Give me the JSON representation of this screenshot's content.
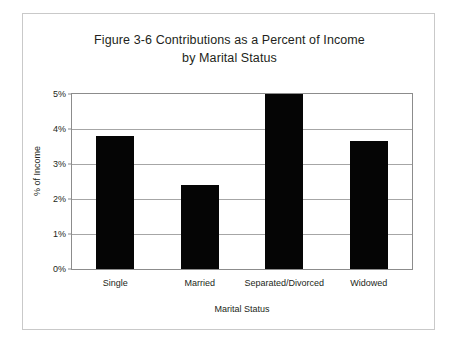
{
  "figure": {
    "border_color": "#c9c9c9",
    "background": "#ffffff"
  },
  "chart_data": {
    "type": "bar",
    "title": "Figure 3-6 Contributions as a Percent of Income by Marital Status",
    "title_line_1": "Figure 3-6 Contributions as a Percent of Income",
    "title_line_2": "by Marital Status",
    "xlabel": "Marital Status",
    "ylabel": "% of Income",
    "categories": [
      "Single",
      "Married",
      "Separated/Divorced",
      "Widowed"
    ],
    "values": [
      3.8,
      2.4,
      5.0,
      3.65
    ],
    "value_labels": [
      "3.8%",
      "2.4%",
      "5.0%",
      "3.65%"
    ],
    "ylim": [
      0,
      5
    ],
    "ytick_values": [
      0,
      1,
      2,
      3,
      4,
      5
    ],
    "ytick_labels": [
      "0%",
      "1%",
      "2%",
      "3%",
      "4%",
      "5%"
    ],
    "grid": true,
    "grid_axis": "y",
    "legend": false,
    "bar_color": "#050505",
    "gridline_color": "#a6a6a6",
    "axis_color": "#8c8c8c",
    "text_color": "#231f20"
  }
}
